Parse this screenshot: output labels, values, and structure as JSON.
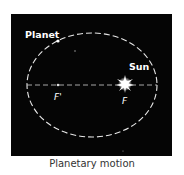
{
  "diagram": {
    "title": "Planetary motion",
    "background_color": "#050505",
    "orbit_color": "#e8e8e8",
    "labels": {
      "planet": "Planet",
      "sun": "Sun",
      "focus_sun": "F",
      "focus_empty": "F'"
    },
    "elements": {
      "orbit": "dashed ellipse",
      "major_axis": "dashed line through both foci",
      "sun_icon": "star-burst",
      "planet_icon": "small dot on orbit"
    }
  },
  "caption": "Planetary motion"
}
